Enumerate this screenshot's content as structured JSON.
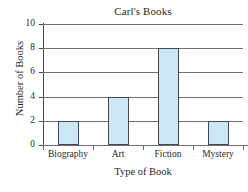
{
  "chart_data": {
    "type": "bar",
    "title": "Carl's Books",
    "xlabel": "Type of Book",
    "ylabel": "Number of Books",
    "categories": [
      "Biography",
      "Art",
      "Fiction",
      "Mystery"
    ],
    "values": [
      2,
      4,
      8,
      2
    ],
    "ylim": [
      0,
      10
    ],
    "yticks": [
      0,
      2,
      4,
      6,
      8,
      10
    ],
    "ytick_labels": [
      "0",
      "2",
      "4",
      "6",
      "8",
      "10"
    ],
    "grid": "horizontal",
    "legend": "none",
    "bar_fill_color": "#cbe6f4",
    "bar_edge_color": "#3f4a52",
    "gridline_color": "#6e6e6e",
    "axis_color": "#4a4a4a",
    "background_color": "#ffffff"
  }
}
